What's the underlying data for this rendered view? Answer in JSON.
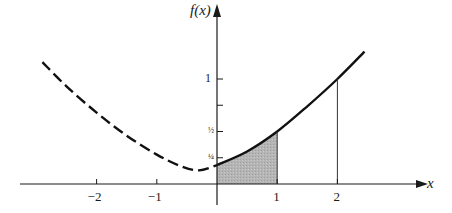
{
  "chart_data": {
    "type": "line",
    "title": "",
    "xlabel": "x",
    "ylabel": "f(x)",
    "x_ticks": [
      -2,
      -1,
      1,
      2
    ],
    "x_tick_labels": [
      "−2",
      "−1",
      "1",
      "2"
    ],
    "y_ticks": [
      0.25,
      0.5,
      1
    ],
    "y_tick_labels": [
      "¼",
      "½",
      "1"
    ],
    "xlim": [
      -3.3,
      3.7
    ],
    "ylim": [
      -0.25,
      1.75
    ],
    "series": [
      {
        "name": "f(x) dashed (x<0)",
        "style": "dashed",
        "x": [
          -2.9,
          -2.5,
          -2,
          -1.5,
          -1,
          -0.6,
          -0.3,
          0
        ],
        "y": [
          1.16,
          0.93,
          0.68,
          0.46,
          0.28,
          0.17,
          0.13,
          0.18
        ]
      },
      {
        "name": "f(x) solid (x>=0)",
        "style": "solid",
        "x": [
          0,
          0.5,
          1,
          1.5,
          2,
          2.45
        ],
        "y": [
          0.18,
          0.31,
          0.5,
          0.74,
          1.0,
          1.26
        ]
      }
    ],
    "shaded_region": {
      "from": 0,
      "to": 1,
      "color": "#b3b3b3"
    },
    "vertical_lines": [
      1,
      2
    ],
    "grid": false,
    "legend": null
  },
  "axes": {
    "x_label": "x",
    "y_label": "f(x)"
  }
}
